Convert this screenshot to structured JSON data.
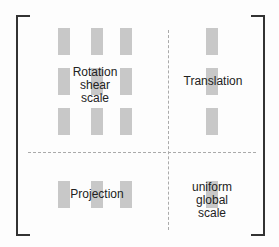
{
  "diagram": {
    "title": "",
    "regions": {
      "rotation": {
        "label_lines": [
          "Rotation",
          "shear",
          "scale"
        ]
      },
      "translation": {
        "label": "Translation"
      },
      "projection": {
        "label": "Projection"
      },
      "uniform": {
        "label_lines": [
          "uniform",
          "global",
          "scale"
        ]
      }
    },
    "colors": {
      "cell": "#c8c8c8",
      "bracket": "#333333",
      "divider": "#aaaaaa"
    }
  }
}
